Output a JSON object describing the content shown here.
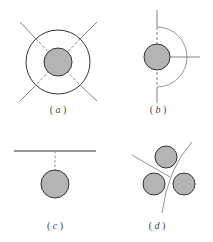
{
  "figure": {
    "width": 213,
    "height": 242,
    "colors": {
      "line": "#555555",
      "circle_stroke": "#333333",
      "circle_fill": "#b4b4b4",
      "background": "#ffffff"
    },
    "panels": [
      {
        "id": "a",
        "label_open": "( ",
        "label_letter": "a",
        "label_close": " )",
        "description": "Gray circle inside concentric ring with two diagonal crossing lines, dashed inside ring"
      },
      {
        "id": "b",
        "label_open": "( ",
        "label_letter": "b",
        "label_close": " )",
        "description": "Gray circle on vertical line with right-side semicircular arc and horizontal radius line"
      },
      {
        "id": "c",
        "label_open": "( ",
        "label_letter": "c",
        "label_close": " )",
        "description": "Gray circle below a horizontal line connected by dashed perpendicular"
      },
      {
        "id": "d",
        "label_open": "( ",
        "label_letter": "d",
        "label_close": " )",
        "description": "Three gray circles separated by a curved line and a straight line"
      }
    ]
  }
}
